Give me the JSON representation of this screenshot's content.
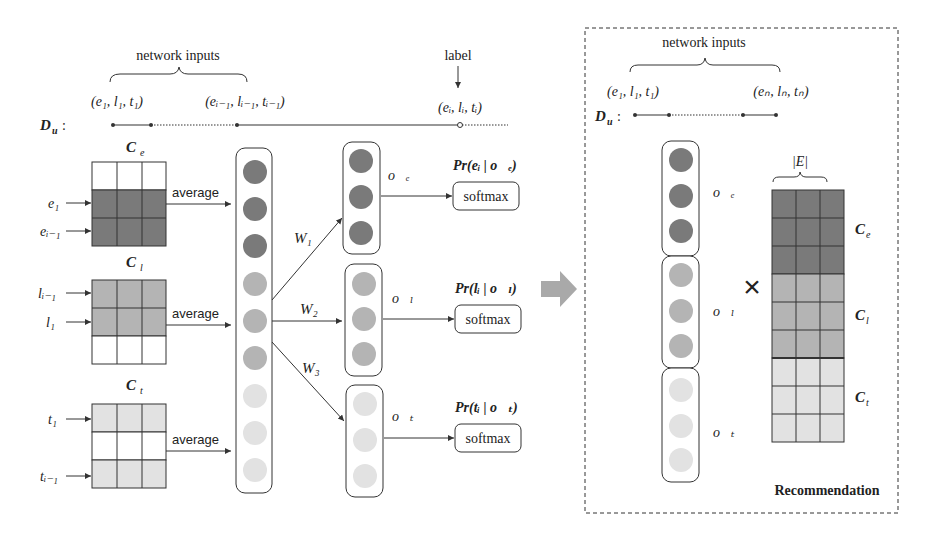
{
  "left": {
    "top_bracket_label": "network inputs",
    "label_text": "label",
    "seq_label": "D",
    "seq_sub": "u",
    "tuples": [
      "(e₁, l₁, t₁)",
      "(eᵢ₋₁, lᵢ₋₁, tᵢ₋₁)",
      "(eᵢ, lᵢ, tᵢ)"
    ],
    "matrices": [
      {
        "name": "C",
        "sub": "e",
        "inputs": [
          "e₁",
          "eᵢ₋₁"
        ],
        "op": "average"
      },
      {
        "name": "C",
        "sub": "l",
        "inputs": [
          "lᵢ₋₁",
          "l₁"
        ],
        "op": "average"
      },
      {
        "name": "C",
        "sub": "t",
        "inputs": [
          "t₁",
          "tᵢ₋₁"
        ],
        "op": "average"
      }
    ],
    "weights": [
      "W₁",
      "W₂",
      "W₃"
    ],
    "outputs": [
      {
        "vec": "o⃗ₑ",
        "prob": "Pr(eᵢ | o⃗ₑ)",
        "fn": "softmax"
      },
      {
        "vec": "o⃗ₗ",
        "prob": "Pr(lᵢ | o⃗ₗ)",
        "fn": "softmax"
      },
      {
        "vec": "o⃗ₜ",
        "prob": "Pr(tᵢ | o⃗ₜ)",
        "fn": "softmax"
      }
    ]
  },
  "right": {
    "top_bracket_label": "network inputs",
    "seq_label": "D",
    "seq_sub": "u",
    "tuples": [
      "(e₁, l₁, t₁)",
      "(eₙ, lₙ, tₙ)"
    ],
    "vectors": [
      "o⃗ₑ",
      "o⃗ₗ",
      "o⃗ₜ"
    ],
    "multiply": "×",
    "matrix_width_label": "|E|",
    "matrix_labels": [
      "C",
      "C",
      "C"
    ],
    "matrix_subs": [
      "e",
      "l",
      "t"
    ],
    "caption": "Recommendation"
  },
  "colors": {
    "dark": "#7a7a7a",
    "mid": "#b4b4b4",
    "light": "#e2e2e2",
    "line": "#333333",
    "arrow_big": "#a9a9a9"
  }
}
